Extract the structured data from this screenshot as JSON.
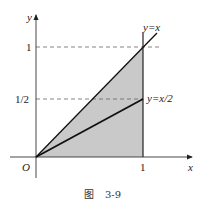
{
  "figure": {
    "caption_prefix": "图",
    "caption_number": "3-9",
    "axes": {
      "x_label": "x",
      "y_label": "y",
      "origin_label": "O",
      "x_ticks": [
        "1"
      ],
      "y_ticks": [
        "1",
        "1/2"
      ]
    },
    "curves": [
      {
        "label": "y=x",
        "equation": "y = x"
      },
      {
        "label": "y=x/2",
        "equation": "y = x/2"
      }
    ],
    "region": {
      "description": "Shaded triangle bounded by y=x, x=1 and the x-axis (0 ≤ y ≤ x, 0 ≤ x ≤ 1)",
      "fill_color": "#c9c9c9"
    },
    "colors": {
      "axis": "#333333",
      "line": "#111111",
      "dash": "#666666"
    }
  }
}
